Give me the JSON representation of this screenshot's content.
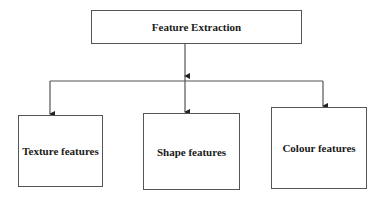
{
  "diagram": {
    "root": {
      "label": "Feature Extraction"
    },
    "children": [
      {
        "label": "Texture features"
      },
      {
        "label": "Shape features"
      },
      {
        "label": "Colour features"
      }
    ],
    "colors": {
      "stroke": "#555555",
      "text": "#1a1a1a",
      "background": "#ffffff"
    }
  }
}
